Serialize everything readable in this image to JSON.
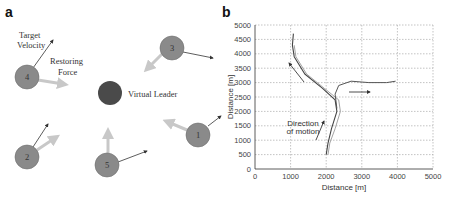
{
  "panel_a": {
    "label": "a",
    "annotations": {
      "target_velocity": [
        "Target",
        "Velocity"
      ],
      "restoring_force": [
        "Restoring",
        "Force"
      ],
      "virtual_leader": "Virtual Leader"
    },
    "agents": [
      {
        "id": "1",
        "cx": 198,
        "cy": 135
      },
      {
        "id": "2",
        "cx": 27,
        "cy": 157
      },
      {
        "id": "3",
        "cx": 172,
        "cy": 48
      },
      {
        "id": "4",
        "cx": 27,
        "cy": 77
      },
      {
        "id": "5",
        "cx": 107,
        "cy": 165
      }
    ],
    "leader": {
      "cx": 110,
      "cy": 93
    },
    "colors": {
      "agent": "#8a8a8a",
      "leader": "#4a4a4a",
      "force_arrow": "#c8c8c8",
      "velocity_arrow": "#333333"
    }
  },
  "panel_b": {
    "label": "b"
  },
  "chart_data": {
    "type": "line",
    "title": "",
    "xlabel": "Distance [m]",
    "ylabel": "Distance [m]",
    "xlim": [
      0,
      5000
    ],
    "ylim": [
      0,
      5000
    ],
    "xticks": [
      "0",
      "1000",
      "2000",
      "3000",
      "4000",
      "5000"
    ],
    "yticks": [
      "0",
      "500",
      "1000",
      "1500",
      "2000",
      "2500",
      "3000",
      "3500",
      "4000",
      "4500",
      "5000"
    ],
    "grid": true,
    "annotations": [
      "Direction",
      "of motion"
    ],
    "series": [
      {
        "name": "trajectory-1",
        "x": [
          2000,
          2050,
          2150,
          2300,
          2250,
          1900,
          1400,
          1100,
          1050,
          1080
        ],
        "y": [
          500,
          900,
          1400,
          2000,
          2400,
          2800,
          3300,
          3900,
          4300,
          4700
        ]
      },
      {
        "name": "trajectory-2",
        "x": [
          2050,
          2100,
          2250,
          2400,
          2350,
          1950,
          1450,
          1150,
          1100
        ],
        "y": [
          500,
          900,
          1400,
          2000,
          2400,
          2800,
          3300,
          3900,
          4300
        ]
      },
      {
        "name": "trajectory-3",
        "x": [
          2300,
          2250,
          2350,
          2700,
          3200,
          3700,
          3950
        ],
        "y": [
          2100,
          2600,
          2900,
          3050,
          3000,
          3000,
          3050
        ]
      }
    ]
  }
}
